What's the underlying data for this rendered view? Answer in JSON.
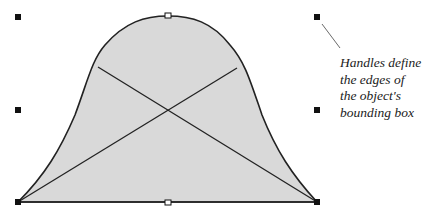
{
  "diagram": {
    "shape": {
      "type": "bell-curve-object",
      "fill": "#d9d9d9",
      "stroke": "#222222"
    },
    "handles": [
      {
        "id": "top-left",
        "x": 18,
        "y": 17
      },
      {
        "id": "top-center",
        "x": 168,
        "y": 16
      },
      {
        "id": "top-right",
        "x": 317,
        "y": 17
      },
      {
        "id": "middle-left",
        "x": 18,
        "y": 110
      },
      {
        "id": "middle-right",
        "x": 317,
        "y": 110
      },
      {
        "id": "bottom-left",
        "x": 18,
        "y": 202
      },
      {
        "id": "bottom-center",
        "x": 168,
        "y": 202
      },
      {
        "id": "bottom-right",
        "x": 317,
        "y": 202
      }
    ],
    "annotation": {
      "lines": [
        "Handles define",
        "the edges of",
        "the object's",
        "bounding box"
      ]
    }
  }
}
